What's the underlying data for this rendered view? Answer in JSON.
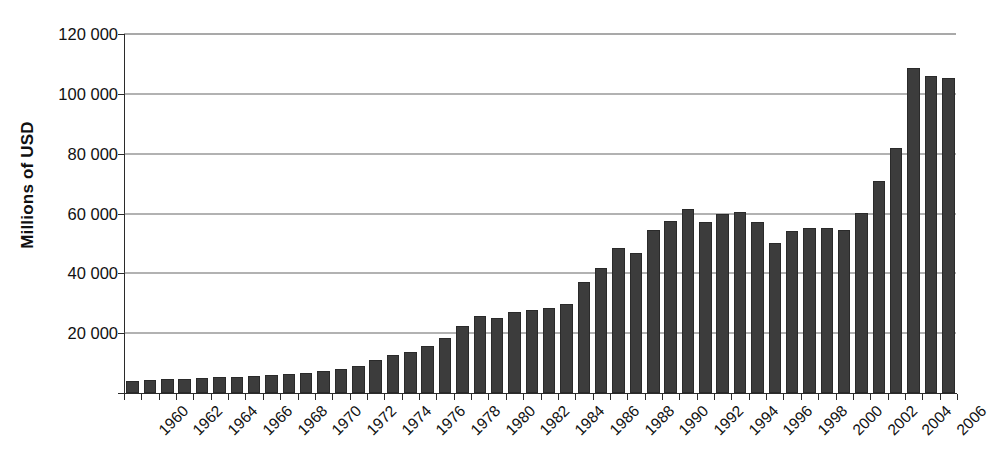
{
  "chart_data": {
    "type": "bar",
    "title": "",
    "xlabel": "",
    "ylabel": "Millions of USD",
    "ylim": [
      0,
      120000
    ],
    "ytick_values": [
      0,
      20000,
      40000,
      60000,
      80000,
      100000,
      120000
    ],
    "ytick_labels": [
      "",
      "20 000",
      "40 000",
      "60 000",
      "80 000",
      "100 000",
      "120 000"
    ],
    "gridlines": true,
    "legend": "none",
    "categories": [
      "1960",
      "1961",
      "1962",
      "1963",
      "1964",
      "1965",
      "1966",
      "1967",
      "1968",
      "1969",
      "1970",
      "1971",
      "1972",
      "1973",
      "1974",
      "1975",
      "1976",
      "1977",
      "1978",
      "1979",
      "1980",
      "1981",
      "1982",
      "1983",
      "1984",
      "1985",
      "1986",
      "1987",
      "1988",
      "1989",
      "1990",
      "1991",
      "1992",
      "1993",
      "1994",
      "1995",
      "1996",
      "1997",
      "1998",
      "1999",
      "2000",
      "2001",
      "2002",
      "2003",
      "2004",
      "2005",
      "2006",
      "2007"
    ],
    "xtick_labels": [
      "1960",
      "1962",
      "1964",
      "1966",
      "1968",
      "1970",
      "1972",
      "1974",
      "1976",
      "1978",
      "1980",
      "1982",
      "1984",
      "1986",
      "1988",
      "1990",
      "1992",
      "1994",
      "1996",
      "1998",
      "2000",
      "2002",
      "2004",
      "2006"
    ],
    "values": [
      4000,
      4300,
      4600,
      4800,
      5000,
      5200,
      5400,
      5600,
      5900,
      6200,
      6600,
      7200,
      8000,
      8900,
      11200,
      12800,
      13800,
      15600,
      18400,
      22400,
      25600,
      25200,
      27200,
      27600,
      28400,
      29600,
      37000,
      41800,
      48400,
      46800,
      54400,
      57600,
      61600,
      57200,
      60000,
      60400,
      57200,
      50000,
      54000,
      55000,
      55200,
      54600,
      60200,
      70800,
      81800,
      108800,
      106000,
      105200
    ],
    "bar_color": "#3c3c3c",
    "axis_color": "#2b2b2b",
    "grid_color": "#666666",
    "background": "#ffffff"
  }
}
